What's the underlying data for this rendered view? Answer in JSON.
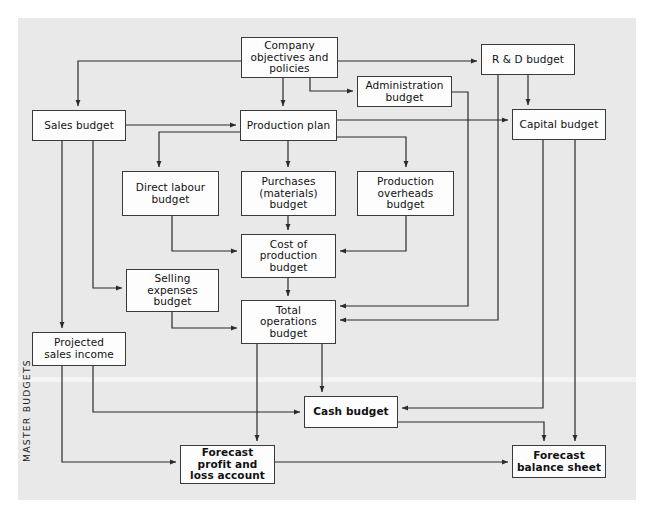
{
  "diagram": {
    "background": "#e9e9e9",
    "box_fill": "#fdfdfd",
    "line_color": "#2b2b2b",
    "side_label": "MASTER BUDGETS",
    "nodes": [
      {
        "id": "company",
        "label": "Company\nobjectives and\npolicies",
        "x": 241,
        "y": 37,
        "w": 97,
        "h": 41,
        "bold": false
      },
      {
        "id": "rd",
        "label": "R & D budget",
        "x": 481,
        "y": 44,
        "w": 94,
        "h": 31,
        "bold": false
      },
      {
        "id": "administration",
        "label": "Administration\nbudget",
        "x": 357,
        "y": 76,
        "w": 95,
        "h": 31,
        "bold": false
      },
      {
        "id": "sales",
        "label": "Sales budget",
        "x": 32,
        "y": 110,
        "w": 94,
        "h": 31,
        "bold": false
      },
      {
        "id": "production_plan",
        "label": "Production plan",
        "x": 240,
        "y": 110,
        "w": 97,
        "h": 31,
        "bold": false
      },
      {
        "id": "capital",
        "label": "Capital budget",
        "x": 512,
        "y": 109,
        "w": 94,
        "h": 31,
        "bold": false
      },
      {
        "id": "direct_labour",
        "label": "Direct labour\nbudget",
        "x": 122,
        "y": 171,
        "w": 97,
        "h": 45,
        "bold": false
      },
      {
        "id": "purchases",
        "label": "Purchases\n(materials)\nbudget",
        "x": 241,
        "y": 171,
        "w": 95,
        "h": 45,
        "bold": false
      },
      {
        "id": "prod_overheads",
        "label": "Production\noverheads\nbudget",
        "x": 357,
        "y": 171,
        "w": 97,
        "h": 45,
        "bold": false
      },
      {
        "id": "cost_of_prod",
        "label": "Cost of\nproduction\nbudget",
        "x": 241,
        "y": 234,
        "w": 95,
        "h": 44,
        "bold": false
      },
      {
        "id": "selling",
        "label": "Selling\nexpenses\nbudget",
        "x": 126,
        "y": 269,
        "w": 93,
        "h": 43,
        "bold": false
      },
      {
        "id": "total_ops",
        "label": "Total\noperations\nbudget",
        "x": 241,
        "y": 300,
        "w": 95,
        "h": 44,
        "bold": false
      },
      {
        "id": "projected",
        "label": "Projected\nsales income",
        "x": 32,
        "y": 332,
        "w": 94,
        "h": 34,
        "bold": false
      },
      {
        "id": "cash",
        "label": "Cash budget",
        "x": 304,
        "y": 396,
        "w": 94,
        "h": 32,
        "bold": true
      },
      {
        "id": "forecast_pl",
        "label": "Forecast\nprofit and\nloss account",
        "x": 180,
        "y": 445,
        "w": 95,
        "h": 39,
        "bold": true
      },
      {
        "id": "forecast_bs",
        "label": "Forecast\nbalance sheet",
        "x": 512,
        "y": 445,
        "w": 94,
        "h": 33,
        "bold": true
      }
    ],
    "connections": [
      {
        "from": "company",
        "to": "sales"
      },
      {
        "from": "company",
        "to": "rd"
      },
      {
        "from": "company",
        "to": "administration"
      },
      {
        "from": "company",
        "to": "production_plan"
      },
      {
        "from": "sales",
        "to": "production_plan"
      },
      {
        "from": "sales",
        "to": "selling"
      },
      {
        "from": "sales",
        "to": "projected"
      },
      {
        "from": "rd",
        "to": "capital"
      },
      {
        "from": "rd",
        "to": "total_ops"
      },
      {
        "from": "administration",
        "to": "total_ops"
      },
      {
        "from": "production_plan",
        "to": "capital"
      },
      {
        "from": "production_plan",
        "to": "direct_labour"
      },
      {
        "from": "production_plan",
        "to": "purchases"
      },
      {
        "from": "production_plan",
        "to": "prod_overheads"
      },
      {
        "from": "direct_labour",
        "to": "cost_of_prod"
      },
      {
        "from": "purchases",
        "to": "cost_of_prod"
      },
      {
        "from": "prod_overheads",
        "to": "cost_of_prod"
      },
      {
        "from": "cost_of_prod",
        "to": "total_ops"
      },
      {
        "from": "selling",
        "to": "total_ops"
      },
      {
        "from": "total_ops",
        "to": "cash"
      },
      {
        "from": "total_ops",
        "to": "forecast_pl"
      },
      {
        "from": "projected",
        "to": "cash"
      },
      {
        "from": "projected",
        "to": "forecast_pl"
      },
      {
        "from": "capital",
        "to": "cash"
      },
      {
        "from": "capital",
        "to": "forecast_bs"
      },
      {
        "from": "cash",
        "to": "forecast_bs"
      },
      {
        "from": "forecast_pl",
        "to": "forecast_bs"
      }
    ]
  }
}
